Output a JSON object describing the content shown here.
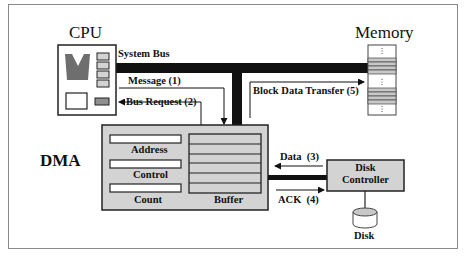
{
  "diagram": {
    "cpu": {
      "title": "CPU"
    },
    "memory": {
      "title": "Memory"
    },
    "dma": {
      "title": "DMA",
      "registers": [
        "Address",
        "Control",
        "Count"
      ],
      "buffer_label": "Buffer",
      "buffer_rows": 6
    },
    "disk_controller": {
      "line1": "Disk",
      "line2": "Controller"
    },
    "disk": {
      "label": "Disk"
    },
    "bus": {
      "label": "System Bus"
    },
    "signals": {
      "message": "Message (1)",
      "bus_request": "Bus Request (2)",
      "data": "Data  (3)",
      "ack": "ACK  (4)",
      "block_transfer": "Block Data Transfer (5)"
    },
    "colors": {
      "fill_gray": "#d3d3d3",
      "dark_gray": "#6e6e6e",
      "bus_black": "#111111",
      "frame": "#8a8a8a"
    }
  }
}
